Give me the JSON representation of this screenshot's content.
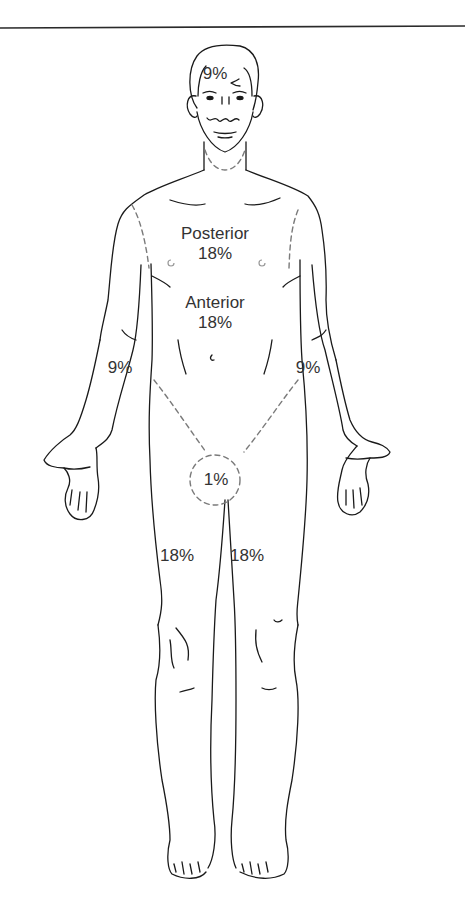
{
  "figure": {
    "type": "rule-of-nines body diagram",
    "view": "front",
    "colors": {
      "line": "#1a1a1a",
      "dashed": "#7a7a7a",
      "text": "#333333",
      "background": "#ffffff"
    }
  },
  "regions": {
    "head": {
      "value": "9%"
    },
    "trunk_posterior": {
      "label": "Posterior",
      "value": "18%"
    },
    "trunk_anterior": {
      "label": "Anterior",
      "value": "18%"
    },
    "right_arm": {
      "value": "9%"
    },
    "left_arm": {
      "value": "9%"
    },
    "perineum": {
      "value": "1%"
    },
    "right_leg": {
      "value": "18%"
    },
    "left_leg": {
      "value": "18%"
    }
  }
}
